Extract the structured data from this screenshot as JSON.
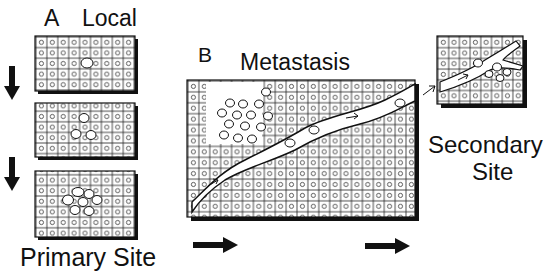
{
  "panel_a": {
    "letter": "A",
    "title": "Local",
    "caption": "Primary Site"
  },
  "panel_b": {
    "letter": "B",
    "title": "Metastasis",
    "secondary_caption_line1": "Secondary",
    "secondary_caption_line2": "Site"
  },
  "colors": {
    "ink": "#111111",
    "background": "#ffffff",
    "shadow": "#111111"
  }
}
